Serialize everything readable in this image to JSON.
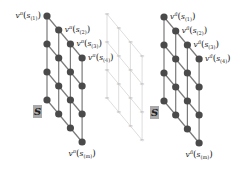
{
  "diagram": {
    "colors": {
      "node": "#4a4a4a",
      "edge": "#7a7a7a",
      "ghost_edge": "#d4d4d4",
      "ghost_marker": "#bdbdbd",
      "s_box": "#a9a9a9",
      "text": "#222222"
    },
    "left_lattice": {
      "value_symbol": "v",
      "policy_superscript": "π",
      "labels": [
        {
          "id": "s1",
          "v": "v",
          "sup": "π",
          "arg": "s",
          "sub": "(1)"
        },
        {
          "id": "s2",
          "v": "v",
          "sup": "π",
          "arg": "s",
          "sub": "(2)"
        },
        {
          "id": "s3",
          "v": "v",
          "sup": "π",
          "arg": "s",
          "sub": "(3)"
        },
        {
          "id": "s4",
          "v": "v",
          "sup": "π",
          "arg": "s",
          "sub": "(4)"
        },
        {
          "id": "sm",
          "v": "v",
          "sup": "π",
          "arg": "s",
          "sub": "(m)"
        }
      ],
      "state_box_label": "S"
    },
    "middle_lattice": {
      "style": "ghost",
      "node_marker": "≈"
    },
    "right_lattice": {
      "value_symbol": "v",
      "policy_superscript": "π̃",
      "labels": [
        {
          "id": "s1",
          "v": "v",
          "sup": "π̃",
          "arg": "s",
          "sub": "(1)"
        },
        {
          "id": "s2",
          "v": "v",
          "sup": "π̃",
          "arg": "s",
          "sub": "(2)"
        },
        {
          "id": "s3",
          "v": "v",
          "sup": "π̃",
          "arg": "s",
          "sub": "(3)"
        },
        {
          "id": "s4",
          "v": "v",
          "sup": "π̃",
          "arg": "s",
          "sub": "(4)"
        },
        {
          "id": "sm",
          "v": "v",
          "sup": "π̃",
          "arg": "s",
          "sub": "(m)"
        }
      ],
      "state_box_label": "S"
    }
  }
}
